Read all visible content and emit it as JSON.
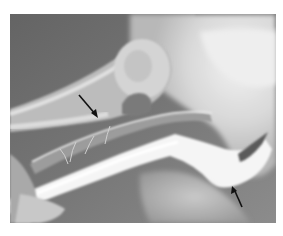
{
  "figure": {
    "type": "radiograph",
    "modality": "grayscale x-ray / angiogram",
    "frame": {
      "x": 10,
      "y": 14,
      "width": 266,
      "height": 209
    },
    "background_color": "#ffffff",
    "tones": {
      "dark_soft_tissue": "#5f5f5f",
      "mid_gray": "#8a8a8a",
      "light_gray": "#bdbdbd",
      "bright_bone": "#e6e6e6",
      "contrast_white": "#f7f7f7",
      "arrow": "#111111"
    },
    "annotations": [
      {
        "id": "arrow-1",
        "kind": "arrow",
        "direction": "down-right",
        "tail": [
          79,
          95
        ],
        "tip": [
          98,
          118
        ]
      },
      {
        "id": "arrow-2",
        "kind": "arrow",
        "direction": "up-left",
        "tail": [
          242,
          207
        ],
        "tip": [
          232,
          186
        ]
      }
    ]
  }
}
